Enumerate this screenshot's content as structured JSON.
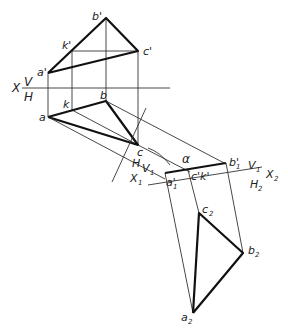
{
  "diagram": {
    "axes": [
      {
        "id": "X-V-H",
        "labels": {
          "x": "X",
          "upper": "V",
          "lower": "H"
        }
      },
      {
        "id": "X1-H-V1",
        "labels": {
          "x": "X1",
          "upper": "H",
          "lower": "V1"
        }
      },
      {
        "id": "X2-V1-H2",
        "labels": {
          "x": "X2",
          "upper": "V1",
          "lower": "H2"
        }
      }
    ],
    "points": {
      "front_view": {
        "a": "a'",
        "b": "b'",
        "c": "c'",
        "k": "k'"
      },
      "top_view": {
        "a": "a",
        "b": "b",
        "c": "c",
        "k": "k"
      },
      "aux_view_1": {
        "a": "a1'",
        "b": "b1'",
        "ck": "c1'k1'"
      },
      "aux_view_2": {
        "a": "a2",
        "b": "b2",
        "c": "c2"
      }
    },
    "angle_label": "α"
  },
  "labels": {
    "b_prime": "b'",
    "k_prime": "k'",
    "c_prime": "c'",
    "a_prime": "a'",
    "X": "X",
    "V": "V",
    "H": "H",
    "k": "k",
    "b": "b",
    "a": "a",
    "c": "c",
    "alpha": "α",
    "b1_prime": "b'",
    "b1_sub": "1",
    "V1": "V",
    "V1_sub": "1",
    "X2": "X",
    "X2_sub": "2",
    "H2": "H",
    "H2_sub": "2",
    "a1_prime": "a'",
    "a1_sub": "1",
    "c1k1": "c'k'",
    "c1k1_sub": "1 1",
    "H_axis1": "H",
    "V1_axis1": "V",
    "V1_axis1_sub": "1",
    "X1": "X",
    "X1_sub": "1",
    "c2": "c",
    "c2_sub": "2",
    "b2": "b",
    "b2_sub": "2",
    "a2": "a",
    "a2_sub": "2"
  }
}
